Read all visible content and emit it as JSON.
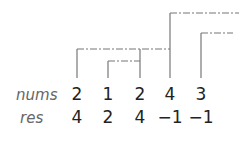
{
  "labels": {
    "row1": "nums",
    "row2": "res"
  },
  "nums": [
    "2",
    "1",
    "2",
    "4",
    "3"
  ],
  "res": [
    "4",
    "2",
    "4",
    "−1",
    "−1"
  ],
  "columns_x": [
    77,
    108,
    140,
    170,
    201
  ],
  "line_color": "#777777",
  "brackets": [
    {
      "from_index": 0,
      "to_index": 3,
      "top_y": 49
    },
    {
      "from_index": 1,
      "to_index": 2,
      "top_y": 61
    },
    {
      "from_index": 2,
      "to_index": 3,
      "top_y": 49
    },
    {
      "from_index": 3,
      "to": "none",
      "top_y": 13
    },
    {
      "from_index": 4,
      "to": "none",
      "top_y": 33
    }
  ]
}
